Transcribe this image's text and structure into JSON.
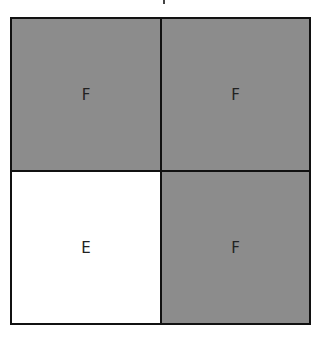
{
  "diagram": {
    "cells": [
      {
        "label": "F",
        "state": "filled"
      },
      {
        "label": "F",
        "state": "filled"
      },
      {
        "label": "E",
        "state": "empty"
      },
      {
        "label": "F",
        "state": "filled"
      }
    ],
    "colors": {
      "filled": "#8c8c8c",
      "empty": "#ffffff",
      "border": "#111111"
    }
  }
}
